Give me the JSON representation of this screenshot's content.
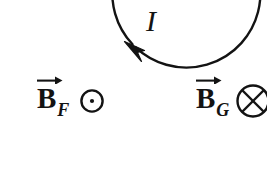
{
  "figure": {
    "background_color": "#ffffff",
    "ink_color": "#131313",
    "width": 267,
    "height": 188
  },
  "loop": {
    "name": "current-loop",
    "shape": "circle",
    "center_x": 85,
    "center_y": 99,
    "radius": 74,
    "stroke_width": 2.4,
    "stroke_color": "#131313",
    "fill": "none",
    "current_direction": "counterclockwise"
  },
  "current": {
    "label": "I",
    "arrowhead_x": 133,
    "arrowhead_y": 45,
    "arrow_direction": "counterclockwise"
  },
  "inside_field": {
    "base": "B",
    "subscript": "F",
    "symbol": "dot-in-circle",
    "symbol_glyph": "⊙",
    "meaning": "out-of-page",
    "vector_arrow": "→"
  },
  "outside_field": {
    "base": "B",
    "subscript": "G",
    "symbol": "cross-in-circle",
    "symbol_glyph": "⊗",
    "meaning": "into-page",
    "vector_arrow": "→"
  }
}
